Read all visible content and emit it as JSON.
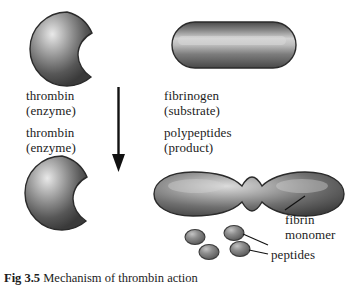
{
  "figure": {
    "caption_label": "Fig 3.5",
    "caption_text": "Mechanism of thrombin action",
    "width": 350,
    "height": 287
  },
  "colors": {
    "shape_dark": "#3a3a3a",
    "shape_mid": "#6e6e6e",
    "shape_light": "#d8d8d8",
    "outline": "#2b2b2b",
    "text": "#1c1c1c",
    "arrow": "#111111",
    "background": "#ffffff"
  },
  "labels": {
    "thrombin_top_name": "thrombin",
    "thrombin_top_role": "(enzyme)",
    "thrombin_bottom_name": "thrombin",
    "thrombin_bottom_role": "(enzyme)",
    "fibrinogen_name": "fibrinogen",
    "fibrinogen_role": "(substrate)",
    "polypeptides_name": "polypeptides",
    "polypeptides_role": "(product)",
    "fibrin_line1": "fibrin",
    "fibrin_line2": "monomer",
    "peptides": "peptides"
  },
  "shapes": {
    "thrombin_top": {
      "name": "thrombin-enzyme-sphere-top"
    },
    "thrombin_bottom": {
      "name": "thrombin-enzyme-sphere-bottom"
    },
    "fibrinogen": {
      "name": "fibrinogen-capsule"
    },
    "fibrin_monomer": {
      "name": "fibrin-monomer-lobed-shape"
    },
    "peptides": {
      "name": "peptide-ovals",
      "count": 4
    }
  },
  "arrow": {
    "name": "reaction-arrow-down",
    "direction": "down"
  }
}
